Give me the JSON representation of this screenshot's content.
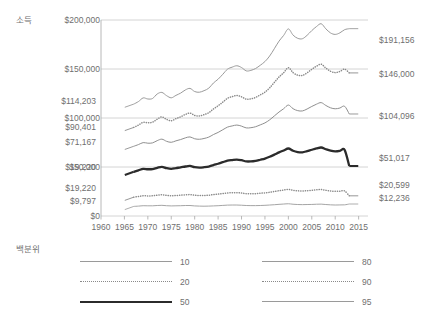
{
  "labels": {
    "y_axis_title": "소득",
    "legend_title": "백분위"
  },
  "chart_data": {
    "type": "line",
    "title": "",
    "xlabel": "",
    "ylabel": "소득",
    "xlim": [
      1960,
      2017
    ],
    "ylim": [
      0,
      200000
    ],
    "grid": true,
    "legend_position": "bottom",
    "legend_title": "백분위",
    "xticks": [
      1960,
      1965,
      1970,
      1975,
      1980,
      1985,
      1990,
      1995,
      2000,
      2005,
      2010,
      2015
    ],
    "yticks": [
      0,
      50000,
      100000,
      150000,
      200000
    ],
    "ytick_labels": [
      "$0",
      "$50,000",
      "$100,000",
      "$150,000",
      "$200,000"
    ],
    "x": [
      1967,
      1968,
      1969,
      1970,
      1971,
      1972,
      1973,
      1974,
      1975,
      1976,
      1977,
      1978,
      1979,
      1980,
      1981,
      1982,
      1983,
      1984,
      1985,
      1986,
      1987,
      1988,
      1989,
      1990,
      1991,
      1992,
      1993,
      1994,
      1995,
      1996,
      1997,
      1998,
      1999,
      2000,
      2001,
      2002,
      2003,
      2004,
      2005,
      2006,
      2007,
      2008,
      2009,
      2010,
      2011,
      2012,
      2013
    ],
    "series": [
      {
        "name": "95",
        "style": "solid-thin",
        "color": "#9a9a9a",
        "start_label": "$114,203",
        "end_label": "$191,156",
        "start_value": 114203,
        "end_value": 191156,
        "values": [
          114203,
          116800,
          120500,
          119400,
          119900,
          124500,
          126100,
          122800,
          120600,
          123100,
          125400,
          128600,
          130200,
          127000,
          126300,
          127900,
          130400,
          135700,
          139600,
          144600,
          149800,
          151900,
          153300,
          151500,
          148100,
          148600,
          150500,
          153800,
          157600,
          163200,
          170700,
          178400,
          184300,
          190900,
          184600,
          181300,
          180900,
          184400,
          189200,
          193300,
          196200,
          191000,
          186800,
          185300,
          186900,
          190100,
          191156
        ]
      },
      {
        "name": "90",
        "style": "dotted",
        "color": "#8a8a8a",
        "start_label": "$90,401",
        "end_label": "$146,000",
        "start_value": 90401,
        "end_value": 146000,
        "values": [
          90401,
          92800,
          95600,
          95100,
          95700,
          98800,
          101100,
          98600,
          97200,
          99300,
          101200,
          103600,
          105000,
          102600,
          102100,
          103400,
          105400,
          109200,
          112500,
          116200,
          120100,
          121800,
          123000,
          121600,
          119200,
          119500,
          121000,
          123600,
          126400,
          130700,
          136300,
          141800,
          146200,
          151400,
          146300,
          143700,
          143400,
          146100,
          149700,
          152800,
          154900,
          151000,
          147700,
          146300,
          147500,
          149900,
          146000
        ]
      },
      {
        "name": "80",
        "style": "solid-thin",
        "color": "#8f8f8f",
        "start_label": "$71,167",
        "end_label": "$104,096",
        "start_value": 71167,
        "end_value": 104096,
        "values": [
          71167,
          72900,
          74900,
          74300,
          74600,
          76900,
          78400,
          76200,
          75200,
          76700,
          78000,
          79700,
          80700,
          78800,
          78300,
          79100,
          80500,
          83100,
          85300,
          88000,
          90700,
          91900,
          92800,
          91700,
          89900,
          90100,
          91100,
          93000,
          95000,
          98100,
          102100,
          106100,
          109500,
          113200,
          109500,
          107500,
          107200,
          109200,
          111800,
          114100,
          115700,
          112800,
          110400,
          109400,
          110200,
          112000,
          104096
        ]
      },
      {
        "name": "50",
        "style": "solid-thick",
        "color": "#2b2b2b",
        "start_label": "$19,220",
        "end_label": "$51,017",
        "start_value": 19220,
        "end_value": 51017,
        "values": [
          45100,
          46600,
          48100,
          47700,
          47900,
          49200,
          50200,
          48800,
          48100,
          48900,
          49600,
          50500,
          51100,
          49800,
          49400,
          49800,
          50500,
          52000,
          53300,
          54900,
          56400,
          57100,
          57600,
          56900,
          55700,
          55700,
          56300,
          57400,
          58600,
          60400,
          62600,
          64900,
          66900,
          68900,
          66600,
          65300,
          65000,
          66200,
          67600,
          68900,
          69900,
          68100,
          66600,
          65900,
          66400,
          67500,
          51017
        ]
      },
      {
        "name": "20",
        "style": "dotted",
        "color": "#8a8a8a",
        "start_label": "$19,220",
        "end_label": "$20,599",
        "start_value": 19220,
        "end_value": 20599,
        "values": [
          19220,
          19900,
          20600,
          20500,
          20600,
          21200,
          21600,
          21000,
          20600,
          20900,
          21200,
          21600,
          21800,
          21200,
          20900,
          20900,
          21200,
          21800,
          22300,
          22900,
          23500,
          23700,
          23800,
          23400,
          22800,
          22700,
          22800,
          23200,
          23600,
          24200,
          25000,
          25800,
          26500,
          27200,
          26200,
          25700,
          25500,
          25800,
          26200,
          26700,
          27000,
          26200,
          25500,
          25200,
          25300,
          25600,
          20599
        ]
      },
      {
        "name": "10",
        "style": "solid-thin",
        "color": "#a5a5a5",
        "start_label": "$9,797",
        "end_label": "$12,236",
        "start_value": 9797,
        "end_value": 12236,
        "values": [
          9797,
          10100,
          10500,
          10400,
          10400,
          10700,
          10900,
          10500,
          10300,
          10400,
          10500,
          10700,
          10700,
          10300,
          10100,
          10000,
          10100,
          10300,
          10500,
          10800,
          11100,
          11200,
          11200,
          11000,
          10700,
          10600,
          10600,
          10700,
          10900,
          11200,
          11500,
          11900,
          12200,
          12500,
          12000,
          11700,
          11600,
          11700,
          11800,
          12000,
          12100,
          11700,
          11400,
          11200,
          11300,
          11400,
          12236
        ]
      }
    ]
  },
  "legend": {
    "items": [
      {
        "label": "10",
        "style": "solid-thin",
        "column": "left"
      },
      {
        "label": "20",
        "style": "dotted",
        "column": "left"
      },
      {
        "label": "50",
        "style": "solid-thick",
        "column": "left"
      },
      {
        "label": "80",
        "style": "solid-thin",
        "column": "right"
      },
      {
        "label": "90",
        "style": "dotted",
        "column": "right"
      },
      {
        "label": "95",
        "style": "solid-thin",
        "column": "right"
      }
    ]
  },
  "colors": {
    "grid": "#c9c9c9",
    "axis": "#b0b0b0",
    "text": "#6f6f6f",
    "dark_series": "#2b2b2b",
    "light_series": "#9a9a9a",
    "background": "#ffffff"
  }
}
